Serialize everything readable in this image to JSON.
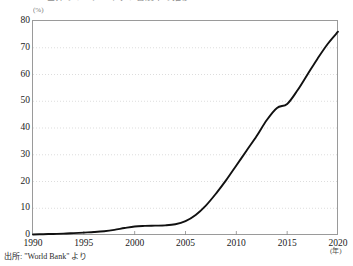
{
  "title": "世界のインターネット普及率の推移",
  "source_note": "出所: \"World Bank\" より",
  "y_unit": "(%)",
  "x_unit": "(年)",
  "colors": {
    "line": "#111111",
    "frame": "#9a9a9a",
    "gridline": "#cfcfcf",
    "text": "#1a1a1a",
    "background": "#ffffff"
  },
  "chart_data": {
    "type": "line",
    "title": "世界のインターネット普及率の推移",
    "xlabel": "(年)",
    "ylabel": "(%)",
    "xlim": [
      1990,
      2020
    ],
    "ylim": [
      0,
      80
    ],
    "grid": "horizontal-dotted",
    "legend": "none",
    "xticks": [
      "1990",
      "1995",
      "2000",
      "2005",
      "2010",
      "2015",
      "2020"
    ],
    "yticks": [
      "0",
      "10",
      "20",
      "30",
      "40",
      "50",
      "60",
      "70",
      "80"
    ],
    "series": [
      {
        "name": "インターネット利用者率",
        "x": [
          1990,
          1991,
          1992,
          1993,
          1994,
          1995,
          1996,
          1997,
          1998,
          1999,
          2000,
          2001,
          2002,
          2003,
          2004,
          2005,
          2006,
          2007,
          2008,
          2009,
          2010,
          2011,
          2012,
          2013,
          2014,
          2015,
          2016,
          2017,
          2018,
          2019,
          2020
        ],
        "values": [
          0.2,
          0.3,
          0.4,
          0.5,
          0.7,
          0.9,
          1.1,
          1.4,
          1.9,
          2.6,
          3.2,
          3.4,
          3.5,
          3.6,
          4.0,
          5.2,
          7.5,
          11.0,
          15.5,
          20.5,
          26.0,
          31.5,
          37.0,
          43.0,
          47.5,
          49.0,
          54.0,
          60.0,
          66.0,
          71.5,
          76.0
        ]
      }
    ]
  }
}
